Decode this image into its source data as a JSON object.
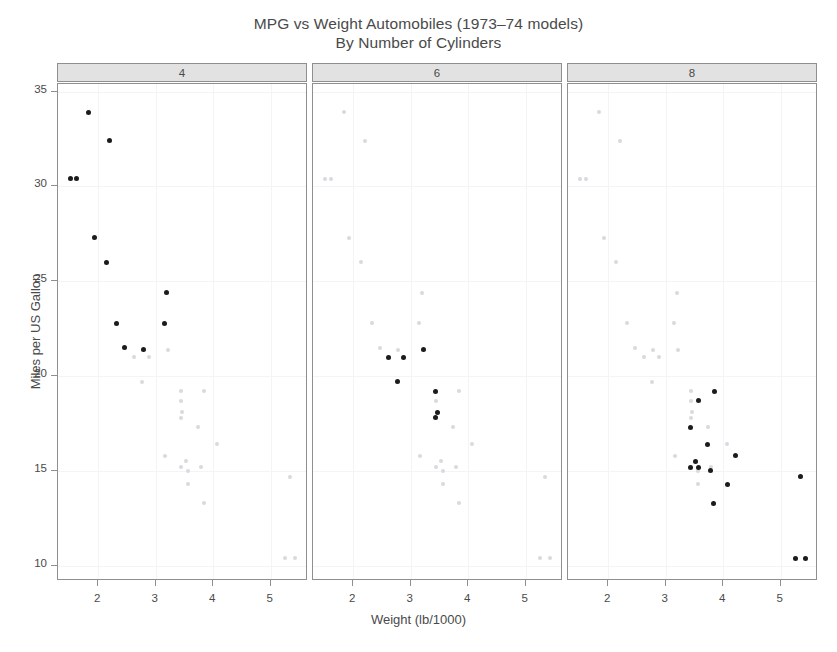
{
  "chart_data": {
    "type": "scatter",
    "title": "MPG vs Weight Automobiles (1973–74 models)",
    "subtitle": "By Number of Cylinders",
    "xlabel": "Weight (lb/1000)",
    "ylabel": "Miles per US Gallon",
    "xlim": [
      1.3,
      5.65
    ],
    "ylim": [
      9.2,
      35.4
    ],
    "xticks": [
      2,
      3,
      4,
      5
    ],
    "yticks": [
      10,
      15,
      20,
      25,
      30,
      35
    ],
    "grid": true,
    "legend": "none",
    "conditioned_by": "Number of Cylinders",
    "panel_labels": [
      "4",
      "6",
      "8"
    ],
    "point_color": "#1c1c1c",
    "ghost_color": "#d9d9de",
    "strip_color": "#e2e2e2",
    "panels": [
      {
        "label": "4",
        "x": [
          2.32,
          3.19,
          3.15,
          2.2,
          1.615,
          1.835,
          2.465,
          1.935,
          2.14,
          1.513,
          2.78
        ],
        "y": [
          22.8,
          24.4,
          22.8,
          32.4,
          30.4,
          33.9,
          21.5,
          27.3,
          26.0,
          30.4,
          21.4
        ]
      },
      {
        "label": "6",
        "x": [
          2.62,
          2.875,
          3.215,
          3.44,
          3.46,
          3.44,
          2.77
        ],
        "y": [
          21.0,
          21.0,
          21.4,
          19.2,
          18.1,
          17.8,
          19.7
        ]
      },
      {
        "label": "8",
        "x": [
          3.44,
          3.57,
          4.07,
          3.73,
          3.78,
          5.25,
          5.424,
          5.345,
          3.52,
          3.435,
          3.84,
          3.845,
          4.215,
          3.57
        ],
        "y": [
          17.3,
          15.2,
          14.3,
          16.4,
          15.0,
          10.4,
          10.4,
          14.7,
          15.5,
          15.2,
          13.3,
          19.2,
          15.8,
          18.7
        ]
      }
    ],
    "all_points": {
      "x": [
        2.62,
        2.875,
        2.32,
        3.215,
        3.44,
        3.46,
        3.57,
        3.19,
        3.15,
        3.44,
        3.44,
        4.07,
        3.73,
        3.78,
        5.25,
        5.424,
        5.345,
        2.2,
        1.615,
        1.835,
        2.465,
        3.52,
        3.435,
        3.84,
        3.845,
        1.935,
        2.14,
        1.513,
        3.17,
        2.77,
        3.57,
        2.78
      ],
      "y": [
        21.0,
        21.0,
        22.8,
        21.4,
        18.7,
        18.1,
        14.3,
        24.4,
        22.8,
        19.2,
        17.8,
        16.4,
        17.3,
        15.2,
        10.4,
        10.4,
        14.7,
        32.4,
        30.4,
        33.9,
        21.5,
        15.5,
        15.2,
        13.3,
        19.2,
        27.3,
        26.0,
        30.4,
        15.8,
        19.7,
        15.0,
        21.4
      ]
    }
  }
}
